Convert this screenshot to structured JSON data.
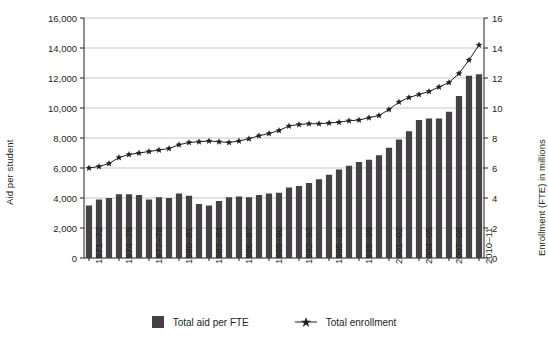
{
  "chart_data": {
    "type": "bar",
    "title": "",
    "xlabel": "",
    "ylabel": "Aid per student",
    "y2label": "Enrollment (FTE) in millions",
    "ylim": [
      0,
      16000
    ],
    "y2lim": [
      0,
      16
    ],
    "grid": true,
    "legend_position": "bottom-center",
    "categories": [
      "1971–72",
      "1972–73",
      "1973–74",
      "1974–75",
      "1975–76",
      "1976–77",
      "1977–78",
      "1978–79",
      "1979–80",
      "1980–81",
      "1981–82",
      "1982–83",
      "1983–84",
      "1984–85",
      "1985–86",
      "1986–87",
      "1987–88",
      "1988–89",
      "1989–90",
      "1990–91",
      "1991–92",
      "1992–93",
      "1993–94",
      "1994–95",
      "1995–96",
      "1996–97",
      "1997–98",
      "1998–99",
      "1999–00",
      "2000–01",
      "2001–02",
      "2002–03",
      "2003–04",
      "2004–05",
      "2005–06",
      "2006–07",
      "2007–08",
      "2008–09",
      "2009–10",
      "2010–11"
    ],
    "tick_labels_x": [
      "1971–72",
      "1974–75",
      "1977–78",
      "1980–81",
      "1983–84",
      "1986–87",
      "1989–90",
      "1992–93",
      "1995–96",
      "1998–99",
      "2001–02",
      "2004–05",
      "2007–08",
      "2010–11"
    ],
    "tick_labels_y_left": [
      "0",
      "2,000",
      "4,000",
      "6,000",
      "8,000",
      "10,000",
      "12,000",
      "14,000",
      "16,000"
    ],
    "tick_values_y_left": [
      0,
      2000,
      4000,
      6000,
      8000,
      10000,
      12000,
      14000,
      16000
    ],
    "tick_labels_y_right": [
      "0",
      "2",
      "4",
      "6",
      "8",
      "10",
      "12",
      "14",
      "16"
    ],
    "tick_values_y_right": [
      0,
      2,
      4,
      6,
      8,
      10,
      12,
      14,
      16
    ],
    "series": [
      {
        "name": "Total aid per FTE",
        "type": "bar",
        "axis": "left",
        "color": "#444244",
        "values": [
          3500,
          3900,
          4000,
          4250,
          4250,
          4200,
          3900,
          4050,
          4000,
          4300,
          4150,
          3600,
          3500,
          3800,
          4050,
          4100,
          4050,
          4200,
          4300,
          4350,
          4700,
          4800,
          5000,
          5250,
          5550,
          5900,
          6150,
          6400,
          6550,
          6850,
          7350,
          7900,
          8450,
          9200,
          9300,
          9300,
          9750,
          10800,
          12150,
          12250
        ]
      },
      {
        "name": "Total enrollment",
        "type": "line",
        "axis": "right",
        "color": "#231f20",
        "marker": "star",
        "values": [
          6.0,
          6.1,
          6.3,
          6.7,
          6.9,
          7.0,
          7.1,
          7.2,
          7.3,
          7.55,
          7.7,
          7.75,
          7.8,
          7.75,
          7.7,
          7.8,
          7.95,
          8.15,
          8.3,
          8.5,
          8.8,
          8.9,
          8.95,
          8.95,
          9.0,
          9.05,
          9.15,
          9.2,
          9.35,
          9.5,
          9.9,
          10.4,
          10.7,
          10.9,
          11.1,
          11.4,
          11.7,
          12.3,
          13.2,
          14.2
        ]
      }
    ]
  },
  "axes": {
    "left_title": "Aid per student",
    "right_title": "Enrollment (FTE) in millions"
  },
  "legend": {
    "items": [
      {
        "label": "Total aid per FTE",
        "marker": "square-swatch"
      },
      {
        "label": "Total enrollment",
        "marker": "star-line"
      }
    ]
  }
}
